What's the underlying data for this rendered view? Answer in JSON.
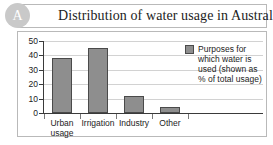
{
  "badge": {
    "label": "A"
  },
  "header": {
    "title": "Distribution of water usage in Australia"
  },
  "legend": {
    "text": "Purposes for which water is used (shown as % of total usage)",
    "swatch_color": "#8e8e8e"
  },
  "chart_data": {
    "type": "bar",
    "title": "Distribution of water usage in Australia",
    "categories": [
      "Urban usage",
      "Irrigation",
      "Industry",
      "Other"
    ],
    "values": [
      38,
      45,
      12,
      4
    ],
    "series": [
      {
        "name": "Purposes for which water is used (shown as % of total usage)",
        "values": [
          38,
          45,
          12,
          4
        ],
        "color": "#8e8e8e"
      }
    ],
    "xlabel": "",
    "ylabel": "",
    "ylim": [
      0,
      50
    ],
    "yticks": [
      0,
      10,
      20,
      30,
      40,
      50
    ],
    "ytick_labels": [
      "0",
      "10",
      "20",
      "30",
      "40",
      "50"
    ],
    "grid": true,
    "legend_position": "right",
    "units": "% of total usage"
  }
}
